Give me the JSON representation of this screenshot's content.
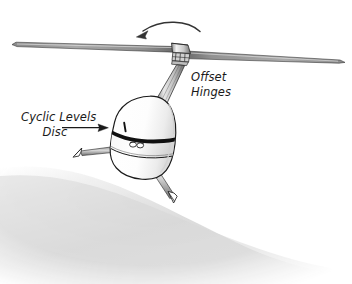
{
  "figure": {
    "view": "three-quarter front view from below",
    "background_color": "#ffffff",
    "ink_color": "#1a1a1a"
  },
  "annotations": [
    {
      "id": "offset-hinges",
      "lines": [
        "Offset",
        "Hinges"
      ],
      "line1": "Offset",
      "line2": "Hinges",
      "x": 191,
      "y": 81,
      "line_height": 15,
      "align": "start",
      "has_leader": false,
      "points_to": "rotor-hub-hinge-block"
    },
    {
      "id": "cyclic-levels-disc",
      "lines": [
        "Cyclic Levels",
        "Disc"
      ],
      "line1": "Cyclic Levels",
      "line2": "Disc",
      "x": 21,
      "y": 121,
      "line_height": 15,
      "align": "start",
      "has_leader": true,
      "points_to": "fuselage-cyclic-mark"
    }
  ],
  "leader_arrow": {
    "id": "cyclic-leader",
    "from_x": 62,
    "from_y": 128,
    "to_x": 106,
    "to_y": 128,
    "color": "#1a1a1a"
  },
  "rotation_arrow": {
    "id": "rotor-rotation-arrow",
    "meaning": "rotor turning direction",
    "direction": "right-to-left (counter-clockwise seen from above)",
    "start_x": 199,
    "start_y": 30,
    "end_x": 138,
    "end_y": 37,
    "color": "#333333"
  },
  "rotor": {
    "hub_x": 178,
    "hub_y": 48,
    "left_blade": {
      "id": "rotor-blade-left",
      "root_x": 172,
      "root_y": 48,
      "tip_x": 14,
      "tip_y": 44,
      "fill": "#b8b8b8"
    },
    "right_blade": {
      "id": "rotor-blade-right",
      "root_x": 188,
      "root_y": 53,
      "tip_x": 343,
      "tip_y": 62,
      "fill": "#a8a8a8"
    }
  },
  "fuselage": {
    "id": "fuselage-dome",
    "center_x": 148,
    "top_y": 97,
    "bottom_y": 180,
    "fill": "#ffffff",
    "band": {
      "id": "fuselage-dark-band",
      "color": "#111111"
    },
    "lights": {
      "id": "fuselage-lights",
      "count": 2
    },
    "cyclic_mark": {
      "id": "fuselage-cyclic-mark",
      "x": 124,
      "y": 129
    }
  },
  "landing_gear": [
    {
      "id": "landing-leg-left",
      "foot_x": 76,
      "foot_y": 152
    },
    {
      "id": "landing-leg-right",
      "foot_x": 172,
      "foot_y": 198
    }
  ],
  "ground_shadow": {
    "id": "ground-shadow",
    "color_light": "#ffffff",
    "color_dark": "#d2d2d2",
    "edge_from_x": 0,
    "edge_from_y": 150,
    "edge_to_x": 352,
    "edge_to_y": 284
  },
  "mast": {
    "id": "rotor-mast",
    "top_x": 176,
    "top_y": 60,
    "bottom_x": 157,
    "bottom_y": 103,
    "fill": "#cfcfcf"
  }
}
